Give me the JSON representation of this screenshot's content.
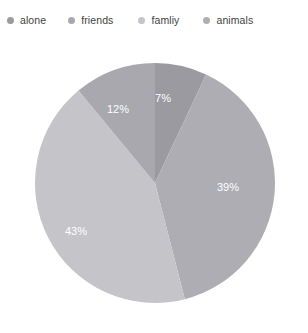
{
  "legend": {
    "position": "top",
    "items": [
      {
        "label": "alone",
        "color": "#9a9aa0",
        "swatch_icon": "dot-icon"
      },
      {
        "label": "friends",
        "color": "#a8a8ae",
        "swatch_icon": "dot-icon"
      },
      {
        "label": "famliy",
        "color": "#c4c4c9",
        "swatch_icon": "dot-icon"
      },
      {
        "label": "animals",
        "color": "#adadb3",
        "swatch_icon": "dot-icon"
      }
    ]
  },
  "chart_data": {
    "type": "pie",
    "title": "",
    "subtitle": "",
    "xlabel": "",
    "ylabel": "",
    "categories": [
      "alone",
      "friends",
      "famliy",
      "animals"
    ],
    "values": [
      7,
      12,
      43,
      39
    ],
    "value_unit": "%",
    "data_labels": [
      "7%",
      "12%",
      "43%",
      "39%"
    ],
    "colors": [
      "#9a9aa0",
      "#a8a8ae",
      "#c4c4c9",
      "#adadb3"
    ],
    "start_angle_deg": 0,
    "direction": "clockwise",
    "grid": false,
    "legend_position": "top",
    "slices": [
      {
        "name": "alone",
        "value": 7,
        "label": "7%",
        "color": "#9a9aa0",
        "start_deg": 0.0,
        "end_deg": 25.2,
        "label_x": 163,
        "label_y": 99
      },
      {
        "name": "animals",
        "value": 39,
        "label": "39%",
        "color": "#adadb3",
        "start_deg": 25.2,
        "end_deg": 165.6,
        "label_x": 228,
        "label_y": 188
      },
      {
        "name": "famliy",
        "value": 43,
        "label": "43%",
        "color": "#c4c4c9",
        "start_deg": 165.6,
        "end_deg": 320.4,
        "label_x": 76,
        "label_y": 232
      },
      {
        "name": "friends",
        "value": 12,
        "label": "12%",
        "color": "#a8a8ae",
        "start_deg": 320.4,
        "end_deg": 360.0,
        "label_x": 118,
        "label_y": 110
      }
    ],
    "center_x": 155,
    "center_y": 183,
    "radius": 120
  }
}
